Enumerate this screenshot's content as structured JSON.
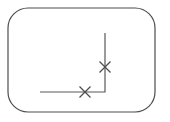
{
  "canvas": {
    "width": 170,
    "height": 122,
    "background_color": "#ffffff"
  },
  "frame": {
    "name": "rounded-rectangle-border",
    "x": 8,
    "y": 8,
    "width": 147,
    "height": 104,
    "corner_radius": 20,
    "stroke_color": "#4d4d4d",
    "stroke_width": 1.2,
    "fill": "none"
  },
  "polyline": {
    "name": "elbow-polyline",
    "stroke_color": "#595959",
    "stroke_width": 1.2,
    "points": [
      {
        "x": 105,
        "y": 33
      },
      {
        "x": 105,
        "y": 92
      },
      {
        "x": 40,
        "y": 92
      }
    ],
    "segments": [
      {
        "label": "vertical-segment",
        "x1": 105,
        "y1": 33,
        "x2": 105,
        "y2": 92
      },
      {
        "label": "horizontal-segment",
        "x1": 105,
        "y1": 92,
        "x2": 40,
        "y2": 92
      }
    ]
  },
  "markers": [
    {
      "label": "cross-marker-upper",
      "shape": "x-cross",
      "cx": 105,
      "cy": 67,
      "size": 11,
      "stroke_color": "#4d4d4d",
      "stroke_width": 1.2
    },
    {
      "label": "cross-marker-lower",
      "shape": "x-cross",
      "cx": 85,
      "cy": 92,
      "size": 11,
      "stroke_color": "#4d4d4d",
      "stroke_width": 1.2
    }
  ]
}
